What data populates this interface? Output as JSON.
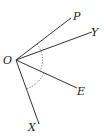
{
  "diagram": {
    "vertex": {
      "label": "O",
      "x": 16,
      "y": 60
    },
    "rays": [
      {
        "label": "P",
        "x": 71,
        "y": 18,
        "label_x": 73,
        "label_y": 20
      },
      {
        "label": "Y",
        "x": 92,
        "y": 32,
        "label_x": 92,
        "label_y": 36
      },
      {
        "label": "E",
        "x": 77,
        "y": 88,
        "label_x": 78,
        "label_y": 95
      },
      {
        "label": "X",
        "x": 39,
        "y": 124,
        "label_x": 28,
        "label_y": 131
      }
    ],
    "arcs": [
      {
        "from": "P",
        "to": "E",
        "style": "dotted"
      },
      {
        "from": "E",
        "to": "X",
        "style": "dotted"
      }
    ]
  }
}
